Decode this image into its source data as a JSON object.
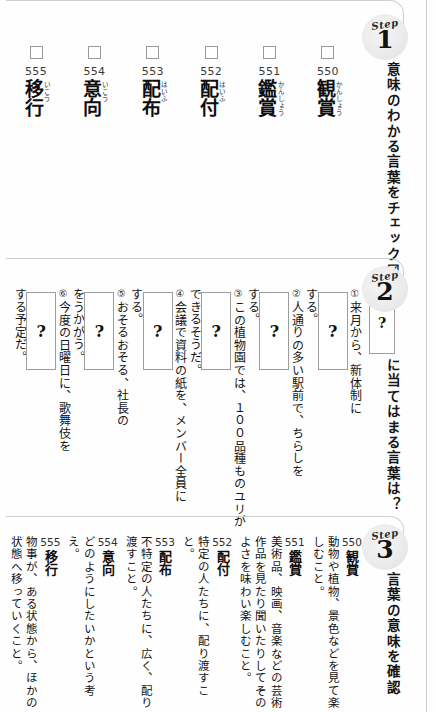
{
  "steps": [
    {
      "badge_word": "Step",
      "badge_num": "1",
      "heading": "意味のわかる言葉をチェック☑"
    },
    {
      "badge_word": "Step",
      "badge_num": "2",
      "heading": "に当てはまる言葉は？",
      "head_blank": "?"
    },
    {
      "badge_word": "Step",
      "badge_num": "3",
      "heading": "言葉の意味を確認"
    }
  ],
  "vocab": [
    {
      "num": "555",
      "kanji": "移行",
      "furigana": "いこう",
      "checked": false
    },
    {
      "num": "554",
      "kanji": "意向",
      "furigana": "いこう",
      "checked": false
    },
    {
      "num": "553",
      "kanji": "配布",
      "furigana": "はいふ",
      "checked": false
    },
    {
      "num": "552",
      "kanji": "配付",
      "furigana": "はいふ",
      "checked": false
    },
    {
      "num": "551",
      "kanji": "鑑賞",
      "furigana": "かんしょう",
      "checked": false
    },
    {
      "num": "550",
      "kanji": "観賞",
      "furigana": "かんしょう",
      "checked": false
    }
  ],
  "questions": [
    {
      "marker": "⑥",
      "before": "今度の日曜日に、歌舞伎を",
      "blank": "?",
      "after": "する予定だ。"
    },
    {
      "marker": "⑤",
      "before": "おそるおそる、社長の",
      "blank": "?",
      "after": "をうかがう。"
    },
    {
      "marker": "④",
      "before": "会議で資料の紙を、メンバー全員に",
      "blank": "?",
      "after": "する。"
    },
    {
      "marker": "③",
      "before": "この植物園では、１００品種ものユリが",
      "blank": "?",
      "after": "できるそうだ。"
    },
    {
      "marker": "②",
      "before": "人通りの多い駅前で、ちらしを",
      "blank": "?",
      "after": "する。"
    },
    {
      "marker": "①",
      "before": "来月から、新体制に",
      "blank": "?",
      "after": "する。"
    }
  ],
  "definitions": [
    {
      "num": "555",
      "word": "移行",
      "text": "物事が、ある状態から、ほかの状態へ移っていくこと。"
    },
    {
      "num": "554",
      "word": "意向",
      "text": "どのようにしたいかという考え。"
    },
    {
      "num": "553",
      "word": "配布",
      "text": "不特定の人たちに、広く、配り渡すこと。"
    },
    {
      "num": "552",
      "word": "配付",
      "text": "特定の人たちに、配り渡すこと。"
    },
    {
      "num": "551",
      "word": "鑑賞",
      "text": "美術品、映画、音楽などの芸術作品を見たり聞いたりしてそのよさを味わい楽しむこと。"
    },
    {
      "num": "550",
      "word": "観賞",
      "text": "動物や植物、景色などを見て楽しむこと。"
    }
  ]
}
